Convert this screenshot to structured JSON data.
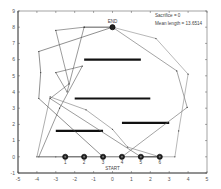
{
  "chart_data": {
    "type": "line",
    "title": "",
    "xlabel": "",
    "ylabel": "",
    "xlim": [
      -5,
      5
    ],
    "ylim": [
      -1,
      9
    ],
    "x_ticks": [
      "-5",
      "-4",
      "-3",
      "-2",
      "-1",
      "0",
      "1",
      "2",
      "3",
      "4",
      "5"
    ],
    "y_ticks": [
      "-1",
      "0",
      "1",
      "2",
      "3",
      "4",
      "5",
      "6",
      "7",
      "8",
      "9"
    ],
    "grid": false,
    "annotations": {
      "sacrifice": "Sacrifice = 0",
      "mean_length": "Mean length = 13.6514",
      "start_label": "START",
      "end_label": "END"
    },
    "end_point": {
      "x": 0,
      "y": 8
    },
    "start_nodes": [
      {
        "label": "1",
        "x": -2.5,
        "y": 0
      },
      {
        "label": "2",
        "x": -1.5,
        "y": 0
      },
      {
        "label": "3",
        "x": -0.5,
        "y": 0
      },
      {
        "label": "4",
        "x": 0.5,
        "y": 0
      },
      {
        "label": "5",
        "x": 1.5,
        "y": 0
      },
      {
        "label": "6",
        "x": 2.5,
        "y": 0
      }
    ],
    "obstacles": [
      {
        "x1": -1.5,
        "x2": 1.5,
        "y": 6.0
      },
      {
        "x1": -2.0,
        "x2": 2.0,
        "y": 3.6
      },
      {
        "x1": 0.5,
        "x2": 3.0,
        "y": 2.1
      },
      {
        "x1": -3.0,
        "x2": -0.5,
        "y": 1.6
      }
    ],
    "series": [
      {
        "name": "path-1",
        "points": [
          [
            -2.5,
            0
          ],
          [
            -3,
            0
          ],
          [
            -3.9,
            0
          ],
          [
            -2.8,
            3.0
          ],
          [
            -1.6,
            5.6
          ],
          [
            -3.0,
            5.2
          ],
          [
            -2.4,
            4.0
          ],
          [
            -1.5,
            8.0
          ],
          [
            0,
            8.0
          ]
        ]
      },
      {
        "name": "path-2",
        "points": [
          [
            -1.5,
            0
          ],
          [
            -4.0,
            0
          ],
          [
            -3.3,
            3.7
          ],
          [
            -1.4,
            2.9
          ],
          [
            0,
            1.7
          ],
          [
            0.8,
            0.6
          ],
          [
            2.5,
            0
          ]
        ]
      },
      {
        "name": "path-3",
        "points": [
          [
            -0.5,
            0
          ],
          [
            -3.9,
            3.6
          ],
          [
            -3.8,
            5.2
          ],
          [
            -3.9,
            6.5
          ],
          [
            0,
            8.0
          ]
        ]
      },
      {
        "name": "path-4",
        "points": [
          [
            0.5,
            0
          ],
          [
            3.95,
            3.05
          ],
          [
            3.4,
            5.3
          ],
          [
            0,
            8.0
          ]
        ]
      },
      {
        "name": "path-5",
        "points": [
          [
            1.5,
            0
          ],
          [
            3.3,
            0
          ],
          [
            3.5,
            1.6
          ],
          [
            4.0,
            5.1
          ],
          [
            2.3,
            7.3
          ],
          [
            0,
            8.0
          ]
        ]
      },
      {
        "name": "path-6",
        "points": [
          [
            2.5,
            0
          ],
          [
            1.5,
            0
          ],
          [
            -3.3,
            3.6
          ],
          [
            -2.3,
            4.5
          ],
          [
            -3.0,
            7.8
          ],
          [
            -1.5,
            8.0
          ],
          [
            0,
            8.0
          ]
        ]
      }
    ]
  }
}
